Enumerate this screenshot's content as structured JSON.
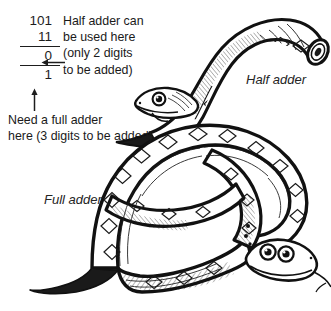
{
  "figure": {
    "background_color": "#ffffff",
    "ink_color": "#1a1a1a",
    "width": 331,
    "height": 311
  },
  "arithmetic": {
    "addend_1": "101",
    "addend_2": "11",
    "partial_sum": "0",
    "carry_row": "1",
    "rule_1": "",
    "rule_2": ""
  },
  "annotations": {
    "right_note_lines": [
      "Half adder can",
      "be used here",
      "(only 2 digits",
      "to be added)"
    ],
    "bottom_note_lines": [
      "Need a full adder",
      "here (3 digits to be added)"
    ],
    "left_arrow": "left-arrow",
    "up_arrow": "up-arrow"
  },
  "labels": {
    "half_adder": "Half adder",
    "full_adder": "Full adder"
  },
  "illustration": {
    "half_adder_snake": "small arched snake with diamond-patterned back, blunt cut tail at upper right and head facing left",
    "full_adder_snake": "large snake coiled into a loop, diamond-patterned back, tapering tail to the lower left and head with two round eyes and forked tongue at lower right"
  }
}
